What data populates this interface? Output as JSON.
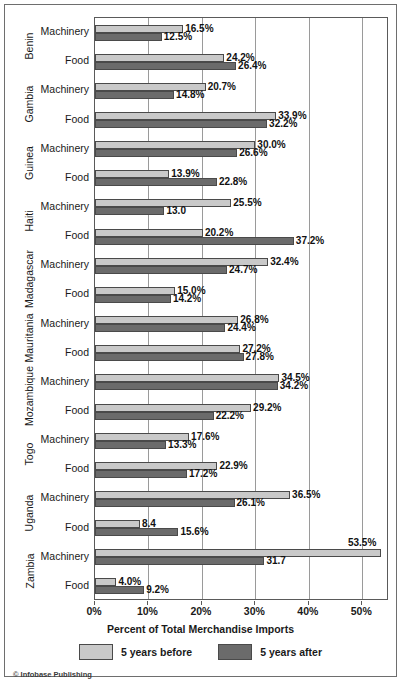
{
  "credit": "© Infobase Publishing",
  "axis": {
    "xlabel": "Percent of Total Merchandise Imports",
    "ticks": [
      "0%",
      "10%",
      "20%",
      "30%",
      "40%",
      "50%"
    ]
  },
  "legend": {
    "items": [
      {
        "label": "5 years before",
        "color": "#c9c9c9",
        "key": "before"
      },
      {
        "label": "5 years after",
        "color": "#6b6b6b",
        "key": "after"
      }
    ]
  },
  "row_labels": {
    "machinery": "Machinery",
    "food": "Food"
  },
  "chart_data": {
    "type": "bar",
    "orientation": "horizontal",
    "title": "",
    "xlabel": "Percent of Total Merchandise Imports",
    "ylabel": "",
    "xlim": [
      0,
      55
    ],
    "xticks": [
      0,
      10,
      20,
      30,
      40,
      50
    ],
    "grid": true,
    "legend_position": "bottom",
    "series": [
      {
        "name": "5 years before",
        "color": "#c9c9c9"
      },
      {
        "name": "5 years after",
        "color": "#6b6b6b"
      }
    ],
    "groups": [
      {
        "country": "Benin",
        "rows": [
          {
            "category": "Machinery",
            "before": 16.5,
            "after": 12.5,
            "before_label": "16.5%",
            "after_label": "12.5%"
          },
          {
            "category": "Food",
            "before": 24.2,
            "after": 26.4,
            "before_label": "24.2%",
            "after_label": "26.4%"
          }
        ]
      },
      {
        "country": "Gambia",
        "rows": [
          {
            "category": "Machinery",
            "before": 20.7,
            "after": 14.8,
            "before_label": "20.7%",
            "after_label": "14.8%"
          },
          {
            "category": "Food",
            "before": 33.9,
            "after": 32.2,
            "before_label": "33.9%",
            "after_label": "32.2%"
          }
        ]
      },
      {
        "country": "Guinea",
        "rows": [
          {
            "category": "Machinery",
            "before": 30.0,
            "after": 26.6,
            "before_label": "30.0%",
            "after_label": "26.6%"
          },
          {
            "category": "Food",
            "before": 13.9,
            "after": 22.8,
            "before_label": "13.9%",
            "after_label": "22.8%"
          }
        ]
      },
      {
        "country": "Haiti",
        "rows": [
          {
            "category": "Machinery",
            "before": 25.5,
            "after": 13.0,
            "before_label": "25.5%",
            "after_label": "13.0"
          },
          {
            "category": "Food",
            "before": 20.2,
            "after": 37.2,
            "before_label": "20.2%",
            "after_label": "37.2%"
          }
        ]
      },
      {
        "country": "Madagascar",
        "rows": [
          {
            "category": "Machinery",
            "before": 32.4,
            "after": 24.7,
            "before_label": "32.4%",
            "after_label": "24.7%"
          },
          {
            "category": "Food",
            "before": 15.0,
            "after": 14.2,
            "before_label": "15.0%",
            "after_label": "14.2%"
          }
        ]
      },
      {
        "country": "Mauritania",
        "rows": [
          {
            "category": "Machinery",
            "before": 26.8,
            "after": 24.4,
            "before_label": "26.8%",
            "after_label": "24.4%"
          },
          {
            "category": "Food",
            "before": 27.2,
            "after": 27.8,
            "before_label": "27.2%",
            "after_label": "27.8%"
          }
        ]
      },
      {
        "country": "Mozambique",
        "rows": [
          {
            "category": "Machinery",
            "before": 34.5,
            "after": 34.2,
            "before_label": "34.5%",
            "after_label": "34.2%"
          },
          {
            "category": "Food",
            "before": 29.2,
            "after": 22.2,
            "before_label": "29.2%",
            "after_label": "22.2%"
          }
        ]
      },
      {
        "country": "Togo",
        "rows": [
          {
            "category": "Machinery",
            "before": 17.6,
            "after": 13.3,
            "before_label": "17.6%",
            "after_label": "13.3%"
          },
          {
            "category": "Food",
            "before": 22.9,
            "after": 17.2,
            "before_label": "22.9%",
            "after_label": "17.2%"
          }
        ]
      },
      {
        "country": "Uganda",
        "rows": [
          {
            "category": "Machinery",
            "before": 36.5,
            "after": 26.1,
            "before_label": "36.5%",
            "after_label": "26.1%"
          },
          {
            "category": "Food",
            "before": 8.4,
            "after": 15.6,
            "before_label": "8.4",
            "after_label": "15.6%"
          }
        ]
      },
      {
        "country": "Zambia",
        "rows": [
          {
            "category": "Machinery",
            "before": 53.5,
            "after": 31.7,
            "before_label": "53.5%",
            "after_label": "31.7"
          },
          {
            "category": "Food",
            "before": 4.0,
            "after": 9.2,
            "before_label": "4.0%",
            "after_label": "9.2%"
          }
        ]
      }
    ]
  }
}
